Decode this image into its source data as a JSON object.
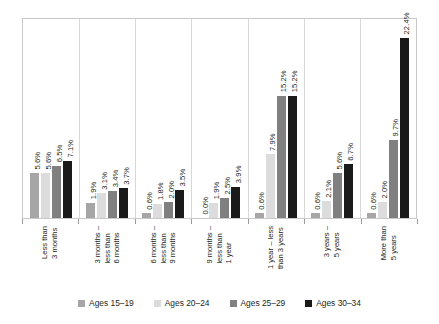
{
  "chart_data": {
    "type": "bar",
    "title": "",
    "subtitle": "",
    "xlabel": "",
    "ylabel": "",
    "ylim": [
      0,
      24
    ],
    "grid": "vertical-category-separators",
    "legend_position": "bottom",
    "value_suffix": "%",
    "categories": [
      "Less than 3 months",
      "3 months – less than 6 months",
      "6 months – less than 9 months",
      "9 months – less than 1 year",
      "1 year – less than 3 years",
      "3 years – 5 years",
      "More than 5 years"
    ],
    "category_lines": [
      [
        "Less than",
        "3 months"
      ],
      [
        "3 months –",
        "less than",
        "6 months"
      ],
      [
        "6 months –",
        "less than",
        "9 months"
      ],
      [
        "9 months –",
        "less than",
        "1 year"
      ],
      [
        "1 year – less",
        "than 3 years"
      ],
      [
        "3 years –",
        "5 years"
      ],
      [
        "More than",
        "5 years"
      ]
    ],
    "series": [
      {
        "name": "Ages 15–19",
        "color": "#a6a6a6",
        "values": [
          5.6,
          1.9,
          0.6,
          0.0,
          0.6,
          0.6,
          0.6
        ],
        "labels": [
          "5.6%",
          "1.9%",
          "0.6%",
          "0.0%",
          "0.6%",
          "0.6%",
          "0.6%"
        ]
      },
      {
        "name": "Ages 20–24",
        "color": "#dcdcdc",
        "values": [
          5.6,
          3.1,
          1.8,
          1.9,
          7.9,
          2.1,
          2.0
        ],
        "labels": [
          "5.6%",
          "3.1%",
          "1.8%",
          "1.9%",
          "7.9%",
          "2.1%",
          "2.0%"
        ]
      },
      {
        "name": "Ages 25–29",
        "color": "#808080",
        "values": [
          6.5,
          3.4,
          2.0,
          2.5,
          15.2,
          5.6,
          9.7
        ],
        "labels": [
          "6.5%",
          "3.4%",
          "2.0%",
          "2.5%",
          "15.2%",
          "5.6%",
          "9.7%"
        ]
      },
      {
        "name": "Ages 30–34",
        "color": "#1a1a1a",
        "values": [
          7.1,
          3.7,
          3.5,
          3.9,
          15.2,
          6.7,
          22.4
        ],
        "labels": [
          "7.1%",
          "3.7%",
          "3.5%",
          "3.9%",
          "15.2%",
          "6.7%",
          "22.4%"
        ]
      }
    ]
  },
  "legend": {
    "items": [
      {
        "label": "Ages 15–19",
        "color": "#a6a6a6"
      },
      {
        "label": "Ages 20–24",
        "color": "#dcdcdc"
      },
      {
        "label": "Ages 25–29",
        "color": "#808080"
      },
      {
        "label": "Ages 30–34",
        "color": "#1a1a1a"
      }
    ]
  }
}
